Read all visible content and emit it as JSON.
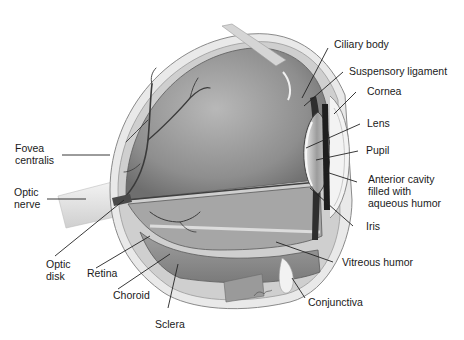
{
  "diagram": {
    "labels": {
      "ciliary_body": "Ciliary body",
      "suspensory_ligament": "Suspensory ligament",
      "cornea": "Cornea",
      "lens": "Lens",
      "pupil": "Pupil",
      "anterior_cavity": [
        "Anterior cavity",
        "filled with",
        "aqueous humor"
      ],
      "iris": "Iris",
      "vitreous_humor": "Vitreous humor",
      "conjunctiva": "Conjunctiva",
      "sclera": "Sclera",
      "choroid": "Choroid",
      "retina": "Retina",
      "optic_disk": [
        "Optic",
        "disk"
      ],
      "optic_nerve": [
        "Optic",
        "nerve"
      ],
      "fovea_centralis": [
        "Fovea",
        "centralis"
      ]
    },
    "colors": {
      "background": "#ffffff",
      "text": "#1a1a1a",
      "leader_line": "#222222",
      "vitreous_fill": "#9a9a9a",
      "sclera_fill": "#e6e6e6",
      "vessel": "#3a3a3a"
    }
  }
}
